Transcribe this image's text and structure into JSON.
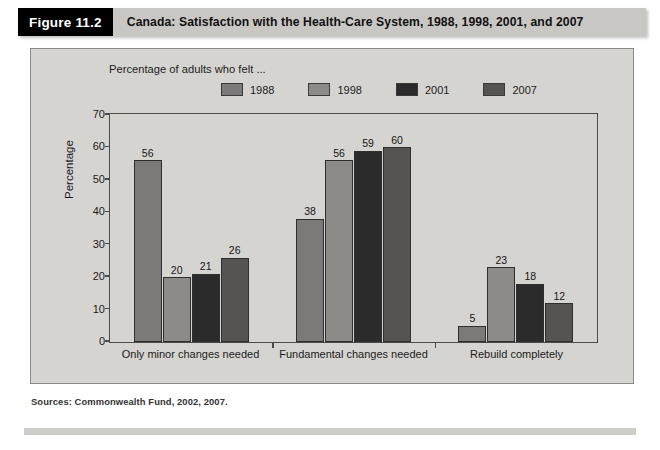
{
  "figure": {
    "tag": "Figure 11.2",
    "title": "Canada: Satisfaction with the Health-Care System, 1988, 1998, 2001, and 2007"
  },
  "legend": {
    "caption": "Percentage of adults who felt ...",
    "items": [
      {
        "label": "1988",
        "color": "#7c7a78"
      },
      {
        "label": "1998",
        "color": "#8d8b88"
      },
      {
        "label": "2001",
        "color": "#2b2b2b"
      },
      {
        "label": "2007",
        "color": "#565452"
      }
    ]
  },
  "source": "Sources: Commonwealth Fund, 2002, 2007.",
  "chart_data": {
    "type": "bar",
    "title": "Canada: Satisfaction with the Health-Care System, 1988, 1998, 2001, and 2007",
    "subtitle": "Percentage of adults who felt ...",
    "categories": [
      "Only minor changes needed",
      "Fundamental changes needed",
      "Rebuild completely"
    ],
    "series": [
      {
        "name": "1988",
        "color": "#7c7a78",
        "values": [
          56,
          38,
          5
        ]
      },
      {
        "name": "1998",
        "color": "#8d8b88",
        "values": [
          20,
          56,
          23
        ]
      },
      {
        "name": "2001",
        "color": "#2b2b2b",
        "values": [
          21,
          59,
          18
        ]
      },
      {
        "name": "2007",
        "color": "#565452",
        "values": [
          26,
          60,
          12
        ]
      }
    ],
    "xlabel": "",
    "ylabel": "Percentage",
    "ylim": [
      0,
      70
    ],
    "yticks": [
      0,
      10,
      20,
      30,
      40,
      50,
      60,
      70
    ],
    "grid": false,
    "legend_position": "top-right",
    "data_labels": true
  }
}
